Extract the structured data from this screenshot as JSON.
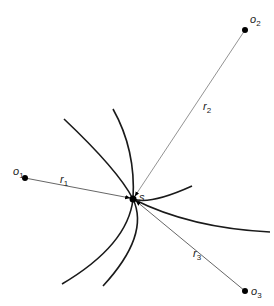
{
  "diagram": {
    "points": [
      {
        "id": "o1",
        "label": "o",
        "sub": "1",
        "x": 25,
        "y": 178
      },
      {
        "id": "o2",
        "label": "o",
        "sub": "2",
        "x": 245,
        "y": 30
      },
      {
        "id": "o3",
        "label": "o",
        "sub": "3",
        "x": 245,
        "y": 291
      },
      {
        "id": "s",
        "label": "s",
        "x": 133,
        "y": 199
      }
    ],
    "ranges": [
      {
        "id": "r1",
        "label": "r",
        "sub": "1",
        "from": "o1",
        "to": "s"
      },
      {
        "id": "r2",
        "label": "r",
        "sub": "2",
        "from": "o2",
        "to": "s"
      },
      {
        "id": "r3",
        "label": "r",
        "sub": "3",
        "from": "o3",
        "to": "s"
      }
    ],
    "colors": {
      "arc": "#1a1a1a",
      "line": "#777777",
      "point": "#000000"
    }
  }
}
